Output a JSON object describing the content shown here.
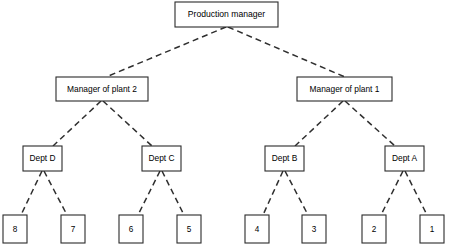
{
  "diagram": {
    "type": "org-chart",
    "line_style": "dashed",
    "colors": {
      "background": "#ffffff",
      "box_fill": "#ffffff",
      "box_stroke": "#2b2b2b",
      "line_stroke": "#2f2f2f",
      "text": "#000000"
    },
    "levels": [
      {
        "level": 0,
        "name": "executive",
        "nodes": [
          {
            "id": "root",
            "label": "Production manager",
            "x": 175,
            "y": 2,
            "w": 103,
            "h": 25
          }
        ]
      },
      {
        "level": 1,
        "name": "plant-managers",
        "nodes": [
          {
            "id": "mgr2",
            "label": "Manager of plant 2",
            "x": 56,
            "y": 77,
            "w": 92,
            "h": 24
          },
          {
            "id": "mgr1",
            "label": "Manager of plant 1",
            "x": 297,
            "y": 77,
            "w": 95,
            "h": 24
          }
        ]
      },
      {
        "level": 2,
        "name": "departments",
        "nodes": [
          {
            "id": "deptD",
            "label": "Dept D",
            "x": 23,
            "y": 146,
            "w": 39,
            "h": 25
          },
          {
            "id": "deptC",
            "label": "Dept C",
            "x": 142,
            "y": 146,
            "w": 39,
            "h": 25
          },
          {
            "id": "deptB",
            "label": "Dept B",
            "x": 265,
            "y": 146,
            "w": 39,
            "h": 25
          },
          {
            "id": "deptA",
            "label": "Dept A",
            "x": 385,
            "y": 146,
            "w": 39,
            "h": 25
          }
        ]
      },
      {
        "level": 3,
        "name": "work-units",
        "nodes": [
          {
            "id": "unit8",
            "label": "8",
            "x": 3,
            "y": 215,
            "w": 24,
            "h": 28
          },
          {
            "id": "unit7",
            "label": "7",
            "x": 61,
            "y": 215,
            "w": 24,
            "h": 28
          },
          {
            "id": "unit6",
            "label": "6",
            "x": 119,
            "y": 215,
            "w": 24,
            "h": 28
          },
          {
            "id": "unit5",
            "label": "5",
            "x": 177,
            "y": 215,
            "w": 24,
            "h": 28
          },
          {
            "id": "unit4",
            "label": "4",
            "x": 245,
            "y": 215,
            "w": 24,
            "h": 28
          },
          {
            "id": "unit3",
            "label": "3",
            "x": 302,
            "y": 215,
            "w": 24,
            "h": 28
          },
          {
            "id": "unit2",
            "label": "2",
            "x": 362,
            "y": 215,
            "w": 24,
            "h": 28
          },
          {
            "id": "unit1",
            "label": "1",
            "x": 420,
            "y": 215,
            "w": 24,
            "h": 28
          }
        ]
      }
    ],
    "edges": [
      {
        "id": "e-root-mgr2",
        "from": "root",
        "to": "mgr2",
        "x1": 226,
        "y1": 27,
        "x2": 106,
        "y2": 77
      },
      {
        "id": "e-root-mgr1",
        "from": "root",
        "to": "mgr1",
        "x1": 228,
        "y1": 27,
        "x2": 345,
        "y2": 77
      },
      {
        "id": "e-mgr2-deptD",
        "from": "mgr2",
        "to": "deptD",
        "x1": 101,
        "y1": 101,
        "x2": 53,
        "y2": 146
      },
      {
        "id": "e-mgr2-deptC",
        "from": "mgr2",
        "to": "deptC",
        "x1": 103,
        "y1": 101,
        "x2": 152,
        "y2": 146
      },
      {
        "id": "e-mgr1-deptB",
        "from": "mgr1",
        "to": "deptB",
        "x1": 343,
        "y1": 101,
        "x2": 295,
        "y2": 146
      },
      {
        "id": "e-mgr1-deptA",
        "from": "mgr1",
        "to": "deptA",
        "x1": 345,
        "y1": 101,
        "x2": 395,
        "y2": 146
      },
      {
        "id": "e-deptD-unit8",
        "from": "deptD",
        "to": "unit8",
        "x1": 42,
        "y1": 171,
        "x2": 21,
        "y2": 215
      },
      {
        "id": "e-deptD-unit7",
        "from": "deptD",
        "to": "unit7",
        "x1": 44,
        "y1": 171,
        "x2": 67,
        "y2": 215
      },
      {
        "id": "e-deptC-unit6",
        "from": "deptC",
        "to": "unit6",
        "x1": 160,
        "y1": 171,
        "x2": 138,
        "y2": 215
      },
      {
        "id": "e-deptC-unit5",
        "from": "deptC",
        "to": "unit5",
        "x1": 162,
        "y1": 171,
        "x2": 184,
        "y2": 215
      },
      {
        "id": "e-deptB-unit4",
        "from": "deptB",
        "to": "unit4",
        "x1": 283,
        "y1": 171,
        "x2": 263,
        "y2": 215
      },
      {
        "id": "e-deptB-unit3",
        "from": "deptB",
        "to": "unit3",
        "x1": 285,
        "y1": 171,
        "x2": 308,
        "y2": 215
      },
      {
        "id": "e-deptA-unit2",
        "from": "deptA",
        "to": "unit2",
        "x1": 403,
        "y1": 171,
        "x2": 381,
        "y2": 215
      },
      {
        "id": "e-deptA-unit1",
        "from": "deptA",
        "to": "unit1",
        "x1": 405,
        "y1": 171,
        "x2": 427,
        "y2": 215
      }
    ]
  }
}
